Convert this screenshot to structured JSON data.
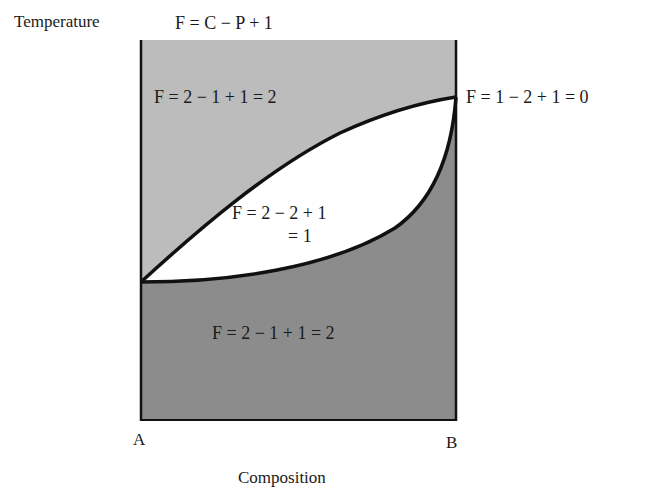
{
  "diagram": {
    "title_equation": "F = C − P + 1",
    "y_axis_label": "Temperature",
    "x_axis_label": "Composition",
    "x_endpoints": {
      "left": "A",
      "right": "B"
    },
    "regions": {
      "upper": {
        "label": "F = 2 − 1 + 1 = 2",
        "color": "#bcbcbc"
      },
      "lens": {
        "label_line1": "F = 2 − 2 + 1",
        "label_line2": "= 1",
        "color": "#ffffff"
      },
      "lower": {
        "label": "F = 2 − 1 + 1 = 2",
        "color": "#8c8c8c"
      }
    },
    "point_label": "F = 1 − 2 + 1 = 0"
  }
}
